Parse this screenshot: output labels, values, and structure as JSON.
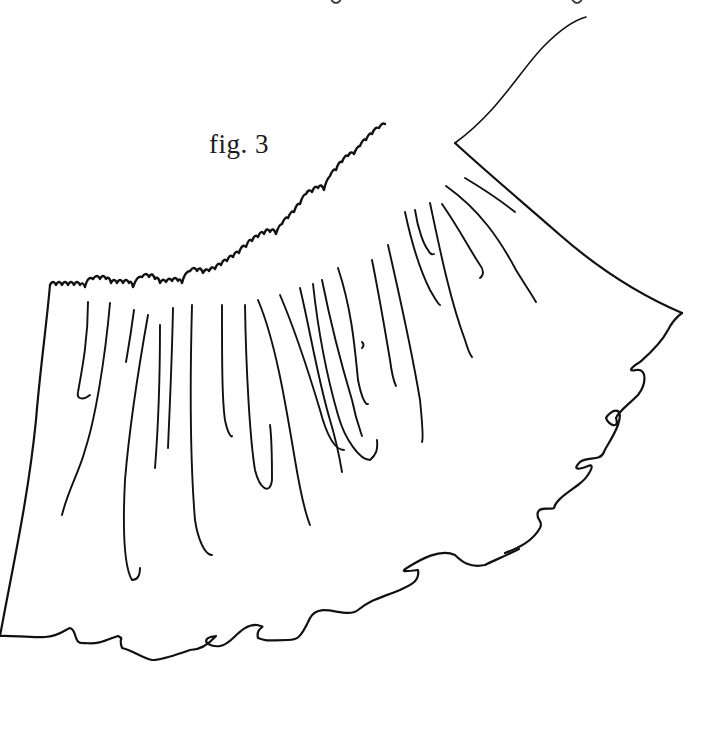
{
  "figure": {
    "label": "fig. 3",
    "stroke_color": "#111111",
    "background_color": "#ffffff"
  },
  "cropped_text_fragments": [
    {
      "glyph": "descender",
      "x": 335
    },
    {
      "glyph": "descender",
      "x": 577
    }
  ]
}
